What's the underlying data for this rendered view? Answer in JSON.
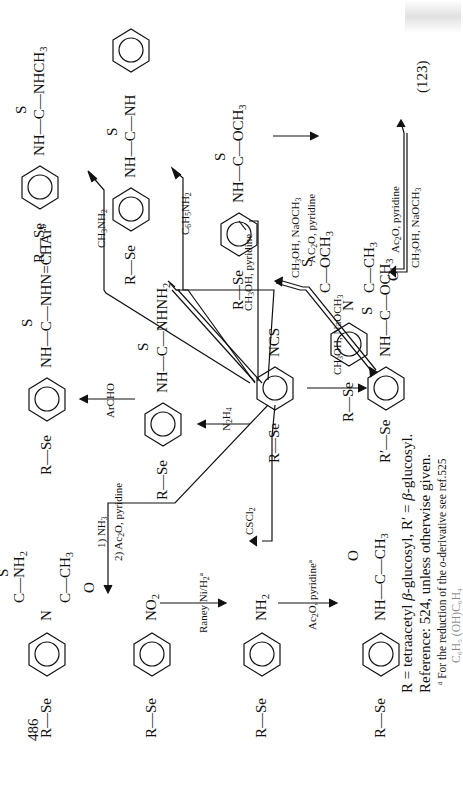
{
  "page": {
    "number": "486",
    "scheme_number": "(123)",
    "orientation": "rotated-90-ccw"
  },
  "compounds": {
    "nitro": {
      "left": "R—Se",
      "right": "NO",
      "right_sub": "2"
    },
    "amine": {
      "left": "R—Se",
      "right": "NH",
      "right_sub": "2"
    },
    "acetamide": {
      "left": "R—Se",
      "right": "NH—C—CH",
      "right_sub": "3",
      "top": "O"
    },
    "isothiocyanate": {
      "left": "R—Se",
      "right": "NCS"
    },
    "thiosemicarbazide": {
      "left": "R—Se",
      "right": "NH—C—NHNH",
      "right_sub": "2",
      "top": "S"
    },
    "thiosemicarbazone": {
      "left": "R—Se",
      "right": "NH—C—NHN=CHAr",
      "right_sup": "b",
      "top": "S"
    },
    "acetyl_thiourea": {
      "left": "R—Se",
      "n": "N",
      "upper": "C—NH",
      "upper_sub": "2",
      "upper_s": "S",
      "lower": "C—CH",
      "lower_sub": "3",
      "lower_o": "O"
    },
    "methyl_thiourea": {
      "left": "R—Se",
      "right": "NH—C—NHCH",
      "right_sub": "3",
      "top": "S"
    },
    "phenyl_thiourea": {
      "left": "R—Se",
      "right": "NH—C—NH",
      "top": "S"
    },
    "thiocarbamate": {
      "left": "R—Se",
      "right": "NH—C—OCH",
      "right_sub": "3",
      "top": "S"
    },
    "thiocarbamate_deacetylated": {
      "left": "R′—Se",
      "right": "NH—C—OCH",
      "right_sub": "3",
      "top": "S"
    },
    "n_acetyl_thiocarbamate": {
      "left": "R—Se",
      "n": "N",
      "upper": "C—OCH",
      "upper_sub": "3",
      "upper_s": "S",
      "lower": "C—CH",
      "lower_sub": "3",
      "lower_o": "O"
    }
  },
  "reagents": {
    "raney": "Raney Ni/H",
    "raney_sub": "2",
    "raney_sup": "a",
    "ac2o_pyr_a": "Ac",
    "ac2o_pyr_a_rest": "O, pyridine",
    "ac2o_pyr_a_sup": "a",
    "cscl2": "CSCl",
    "n2h4": "N",
    "archo": "ArCHO",
    "nh3_step1": "1) NH",
    "ac2o_step2": "2) Ac",
    "ac2o_step2_rest": "O, pyridine",
    "ch3nh2": "CH",
    "ch3nh2_rest": "NH",
    "c6h5nh2": "C",
    "c6h5nh2_mid": "H",
    "c6h5nh2_rest": "NH",
    "ch3oh_pyr": "CH",
    "ch3oh_pyr_rest": "OH, pyridine",
    "ch3oh_naoch3": "CH",
    "ch3oh_naoch3_rest": "OH, NaOCH",
    "ac2o_pyr_b": "AC",
    "ac2o_pyr_b_rest": "O, pyridine",
    "ac2o_pyr_c": "Ac",
    "ac2o_pyr_c_rest": "O, pyridine"
  },
  "caption": {
    "line1_a": "R = tetraacetyl ",
    "line1_b": "β",
    "line1_c": "-glucosyl, R′ = ",
    "line1_d": "β",
    "line1_e": "-glucosyl.",
    "line2": "Reference: 524, unless otherwise given.",
    "footnote_mark": "a",
    "footnote_a": " For the reduction of the ",
    "footnote_o": "o",
    "footnote_b": "-derivative see ref.525",
    "footnote_cut": "C₆H₅ (OH)C₆H₄"
  }
}
